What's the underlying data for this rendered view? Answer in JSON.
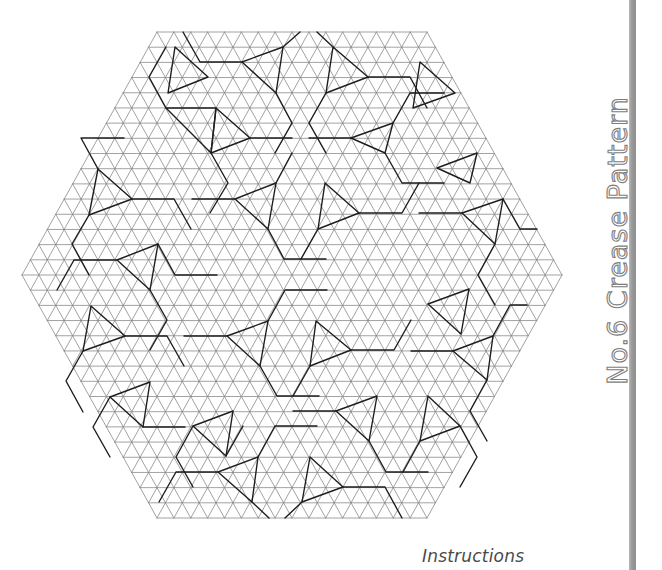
{
  "title": "No.6 Crease Pattern",
  "instructions_label": "Instructions",
  "colors": {
    "grid_line": "#8a8a8a",
    "crease_line": "#1e1e1e",
    "side_bar": "#9a9a9a",
    "title_outline": "#7d7d7d",
    "instructions_text": "#4a4a4a"
  },
  "hexagon": {
    "center": [
      292,
      275
    ],
    "half_width": 270,
    "half_height": 243,
    "subdivisions": 16
  },
  "twists": [
    [
      [
        283,
        47
      ],
      [
        242,
        62
      ],
      [
        276,
        93
      ]
    ],
    [
      [
        333,
        47
      ],
      [
        368,
        77
      ],
      [
        326,
        93
      ]
    ],
    [
      [
        166,
        108
      ],
      [
        216,
        108
      ],
      [
        211,
        153
      ]
    ],
    [
      [
        216,
        108
      ],
      [
        250,
        138
      ],
      [
        211,
        153
      ]
    ],
    [
      [
        393,
        123
      ],
      [
        351,
        138
      ],
      [
        385,
        153
      ]
    ],
    [
      [
        98,
        169
      ],
      [
        132,
        199
      ],
      [
        89,
        215
      ]
    ],
    [
      [
        276,
        183
      ],
      [
        235,
        199
      ],
      [
        268,
        229
      ]
    ],
    [
      [
        325,
        183
      ],
      [
        359,
        213
      ],
      [
        318,
        229
      ]
    ],
    [
      [
        503,
        199
      ],
      [
        462,
        213
      ],
      [
        495,
        244
      ]
    ],
    [
      [
        477,
        153
      ],
      [
        437,
        168
      ],
      [
        470,
        183
      ]
    ],
    [
      [
        158,
        244
      ],
      [
        117,
        260
      ],
      [
        150,
        290
      ]
    ],
    [
      [
        91,
        306
      ],
      [
        125,
        336
      ],
      [
        83,
        351
      ]
    ],
    [
      [
        268,
        321
      ],
      [
        227,
        336
      ],
      [
        260,
        366
      ]
    ],
    [
      [
        316,
        321
      ],
      [
        351,
        350
      ],
      [
        310,
        366
      ]
    ],
    [
      [
        493,
        336
      ],
      [
        453,
        351
      ],
      [
        487,
        380
      ]
    ],
    [
      [
        469,
        289
      ],
      [
        428,
        304
      ],
      [
        461,
        334
      ]
    ],
    [
      [
        150,
        382
      ],
      [
        110,
        397
      ],
      [
        143,
        427
      ]
    ],
    [
      [
        377,
        396
      ],
      [
        336,
        411
      ],
      [
        369,
        441
      ]
    ],
    [
      [
        428,
        396
      ],
      [
        460,
        426
      ],
      [
        420,
        441
      ]
    ],
    [
      [
        233,
        411
      ],
      [
        193,
        426
      ],
      [
        226,
        456
      ]
    ],
    [
      [
        258,
        457
      ],
      [
        218,
        472
      ],
      [
        252,
        502
      ]
    ],
    [
      [
        310,
        457
      ],
      [
        343,
        487
      ],
      [
        302,
        502
      ]
    ],
    [
      [
        175,
        47
      ],
      [
        208,
        77
      ],
      [
        168,
        93
      ]
    ],
    [
      [
        420,
        62
      ],
      [
        455,
        93
      ],
      [
        413,
        108
      ]
    ]
  ],
  "pleats": [
    [
      [
        242,
        62
      ],
      [
        200,
        62
      ],
      [
        183,
        32
      ]
    ],
    [
      [
        283,
        47
      ],
      [
        300,
        32
      ]
    ],
    [
      [
        333,
        47
      ],
      [
        317,
        32
      ]
    ],
    [
      [
        368,
        77
      ],
      [
        410,
        77
      ],
      [
        427,
        108
      ]
    ],
    [
      [
        276,
        93
      ],
      [
        292,
        123
      ],
      [
        275,
        153
      ]
    ],
    [
      [
        326,
        93
      ],
      [
        309,
        123
      ],
      [
        326,
        153
      ]
    ],
    [
      [
        166,
        108
      ],
      [
        149,
        77
      ],
      [
        166,
        47
      ]
    ],
    [
      [
        250,
        138
      ],
      [
        292,
        138
      ]
    ],
    [
      [
        211,
        153
      ],
      [
        228,
        183
      ],
      [
        210,
        213
      ]
    ],
    [
      [
        351,
        138
      ],
      [
        309,
        138
      ]
    ],
    [
      [
        393,
        123
      ],
      [
        410,
        93
      ],
      [
        444,
        93
      ]
    ],
    [
      [
        385,
        153
      ],
      [
        402,
        183
      ],
      [
        444,
        183
      ]
    ],
    [
      [
        132,
        199
      ],
      [
        174,
        199
      ],
      [
        191,
        229
      ]
    ],
    [
      [
        98,
        169
      ],
      [
        81,
        138
      ],
      [
        124,
        138
      ]
    ],
    [
      [
        89,
        215
      ],
      [
        72,
        244
      ],
      [
        89,
        275
      ]
    ],
    [
      [
        235,
        199
      ],
      [
        192,
        199
      ]
    ],
    [
      [
        276,
        183
      ],
      [
        292,
        153
      ]
    ],
    [
      [
        268,
        229
      ],
      [
        284,
        259
      ],
      [
        326,
        259
      ]
    ],
    [
      [
        359,
        213
      ],
      [
        402,
        213
      ],
      [
        419,
        183
      ]
    ],
    [
      [
        318,
        229
      ],
      [
        301,
        259
      ]
    ],
    [
      [
        503,
        199
      ],
      [
        520,
        229
      ],
      [
        537,
        229
      ]
    ],
    [
      [
        462,
        213
      ],
      [
        419,
        213
      ]
    ],
    [
      [
        495,
        244
      ],
      [
        478,
        275
      ],
      [
        495,
        305
      ]
    ],
    [
      [
        117,
        260
      ],
      [
        74,
        260
      ],
      [
        57,
        290
      ]
    ],
    [
      [
        158,
        244
      ],
      [
        175,
        275
      ],
      [
        217,
        275
      ]
    ],
    [
      [
        150,
        290
      ],
      [
        167,
        320
      ],
      [
        150,
        350
      ]
    ],
    [
      [
        125,
        336
      ],
      [
        167,
        336
      ],
      [
        184,
        366
      ]
    ],
    [
      [
        83,
        351
      ],
      [
        66,
        381
      ],
      [
        83,
        412
      ]
    ],
    [
      [
        227,
        336
      ],
      [
        184,
        336
      ]
    ],
    [
      [
        260,
        366
      ],
      [
        277,
        396
      ],
      [
        319,
        396
      ]
    ],
    [
      [
        268,
        321
      ],
      [
        285,
        290
      ],
      [
        327,
        290
      ]
    ],
    [
      [
        351,
        350
      ],
      [
        394,
        350
      ],
      [
        411,
        320
      ]
    ],
    [
      [
        310,
        366
      ],
      [
        293,
        396
      ]
    ],
    [
      [
        453,
        351
      ],
      [
        411,
        351
      ]
    ],
    [
      [
        487,
        380
      ],
      [
        470,
        411
      ],
      [
        487,
        441
      ]
    ],
    [
      [
        493,
        336
      ],
      [
        510,
        305
      ],
      [
        527,
        305
      ]
    ],
    [
      [
        110,
        397
      ],
      [
        93,
        427
      ],
      [
        110,
        457
      ]
    ],
    [
      [
        143,
        427
      ],
      [
        185,
        427
      ]
    ],
    [
      [
        336,
        411
      ],
      [
        293,
        411
      ]
    ],
    [
      [
        369,
        441
      ],
      [
        386,
        472
      ],
      [
        428,
        472
      ]
    ],
    [
      [
        420,
        441
      ],
      [
        403,
        472
      ]
    ],
    [
      [
        460,
        426
      ],
      [
        477,
        457
      ],
      [
        460,
        487
      ]
    ],
    [
      [
        193,
        426
      ],
      [
        176,
        457
      ],
      [
        193,
        487
      ]
    ],
    [
      [
        226,
        456
      ],
      [
        243,
        426
      ]
    ],
    [
      [
        218,
        472
      ],
      [
        176,
        472
      ],
      [
        159,
        502
      ]
    ],
    [
      [
        252,
        502
      ],
      [
        269,
        518
      ]
    ],
    [
      [
        343,
        487
      ],
      [
        385,
        487
      ],
      [
        402,
        518
      ]
    ],
    [
      [
        302,
        502
      ],
      [
        285,
        518
      ]
    ],
    [
      [
        258,
        457
      ],
      [
        275,
        426
      ],
      [
        317,
        426
      ]
    ]
  ]
}
